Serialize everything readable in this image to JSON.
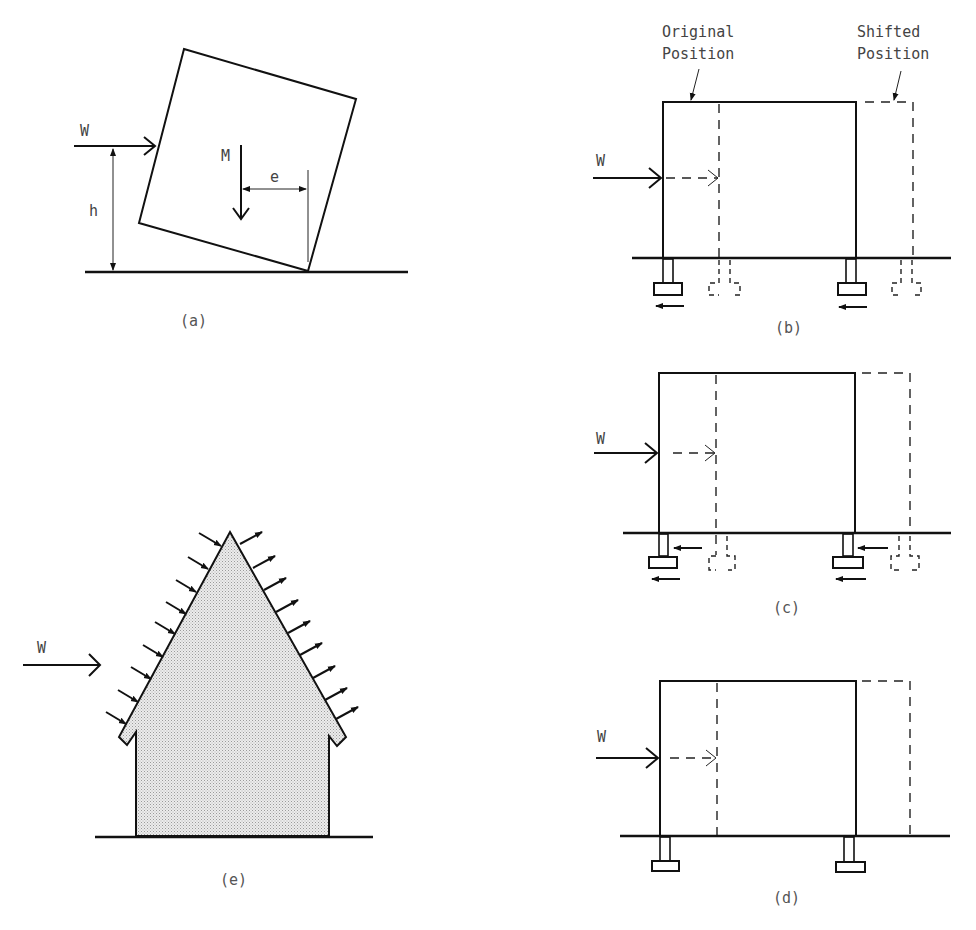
{
  "figure": {
    "panels": [
      {
        "id": "a",
        "caption": "(a)",
        "labels": {
          "wind": "W",
          "mass": "M",
          "height": "h",
          "eccentricity": "e"
        }
      },
      {
        "id": "b",
        "caption": "(b)",
        "labels": {
          "wind": "W",
          "original": "Original Position",
          "original_line1": "Original",
          "original_line2": "Position",
          "shifted_line1": "Shifted",
          "shifted_line2": "Position"
        }
      },
      {
        "id": "c",
        "caption": "(c)",
        "labels": {
          "wind": "W"
        }
      },
      {
        "id": "d",
        "caption": "(d)",
        "labels": {
          "wind": "W"
        }
      },
      {
        "id": "e",
        "caption": "(e)",
        "labels": {
          "wind": "W"
        }
      }
    ],
    "colors": {
      "line": "#111111",
      "text": "#444444",
      "fill": "#e6e6e6"
    }
  }
}
